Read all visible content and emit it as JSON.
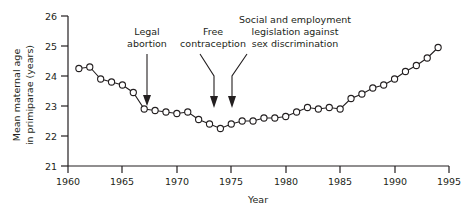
{
  "chart_data": {
    "type": "line",
    "title": "",
    "xlabel": "Year",
    "ylabel": "Mean maternal age in primiparae (years)",
    "ylabel_line1": "Mean maternal age",
    "ylabel_line2": "in primiparae (years)",
    "xlim": [
      1960,
      1995
    ],
    "ylim": [
      21,
      26
    ],
    "xticks": [
      1960,
      1965,
      1970,
      1975,
      1980,
      1985,
      1990,
      1995
    ],
    "yticks": [
      21,
      22,
      23,
      24,
      25,
      26
    ],
    "grid": false,
    "legend": "none",
    "marker": "open-circle",
    "line_color": "#231f20",
    "marker_fill": "#ffffff",
    "x": [
      1961,
      1962,
      1963,
      1964,
      1965,
      1966,
      1967,
      1968,
      1969,
      1970,
      1971,
      1972,
      1973,
      1974,
      1975,
      1976,
      1977,
      1978,
      1979,
      1980,
      1981,
      1982,
      1983,
      1984,
      1985,
      1986,
      1987,
      1988,
      1989,
      1990,
      1991,
      1992,
      1993,
      1994
    ],
    "values": [
      24.25,
      24.3,
      23.9,
      23.8,
      23.7,
      23.45,
      22.9,
      22.85,
      22.8,
      22.75,
      22.8,
      22.55,
      22.4,
      22.25,
      22.4,
      22.5,
      22.5,
      22.6,
      22.6,
      22.65,
      22.8,
      22.95,
      22.9,
      22.95,
      22.9,
      23.25,
      23.4,
      23.6,
      23.7,
      23.9,
      24.15,
      24.35,
      24.6,
      24.95
    ],
    "annotations": [
      {
        "id": "legal-abortion",
        "text_line1": "Legal",
        "text_line2": "abortion",
        "target_year": 1967,
        "target_value": 22.9
      },
      {
        "id": "free-contraception",
        "text_line1": "Free",
        "text_line2": "contraception",
        "target_year": 1974,
        "target_value": 22.3
      },
      {
        "id": "sex-discrimination",
        "text_line1": "Social and employment",
        "text_line2": "legislation against",
        "text_line3": "sex discrimination",
        "target_year": 1975,
        "target_value": 22.4
      }
    ]
  }
}
